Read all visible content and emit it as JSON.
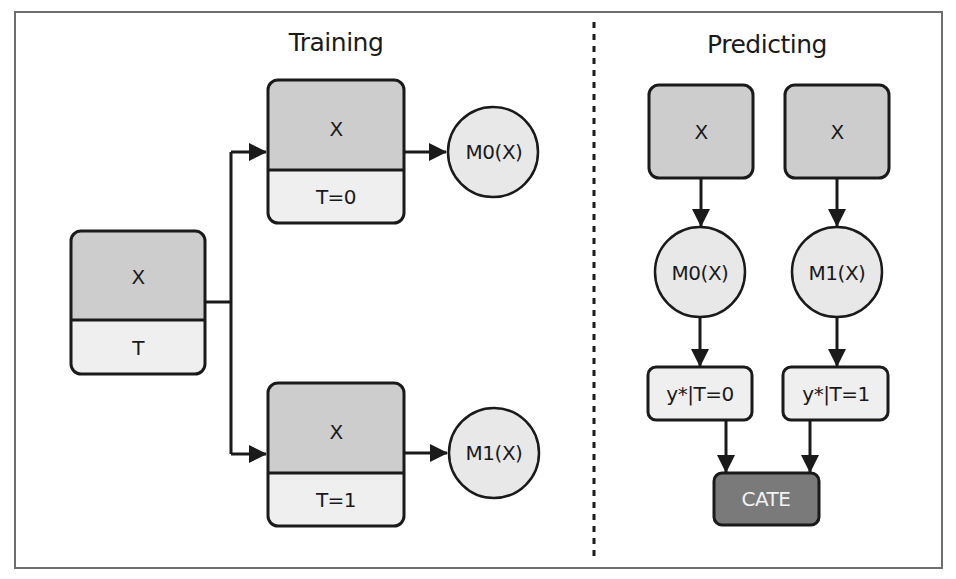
{
  "diagram": {
    "colors": {
      "stroke": "#1a1a1a",
      "x_fill": "#cdcdcd",
      "t_fill": "#efefef",
      "model_fill": "#e8e8e8",
      "output_fill": "#efefef",
      "cate_fill": "#7a7a7a",
      "frame": "#6e6e6e"
    },
    "training": {
      "title": "Training",
      "input_box": {
        "feature_label": "X",
        "treatment_label": "T"
      },
      "control_box": {
        "feature_label": "X",
        "treatment_label": "T=0"
      },
      "treated_box": {
        "feature_label": "X",
        "treatment_label": "T=1"
      },
      "control_model": {
        "label": "M0(X)"
      },
      "treated_model": {
        "label": "M1(X)"
      }
    },
    "predicting": {
      "title": "Predicting",
      "input_left": {
        "label": "X"
      },
      "input_right": {
        "label": "X"
      },
      "model_left": {
        "label": "M0(X)"
      },
      "model_right": {
        "label": "M1(X)"
      },
      "output_left": {
        "label": "y*|T=0"
      },
      "output_right": {
        "label": "y*|T=1"
      },
      "result": {
        "label": "CATE"
      }
    }
  }
}
